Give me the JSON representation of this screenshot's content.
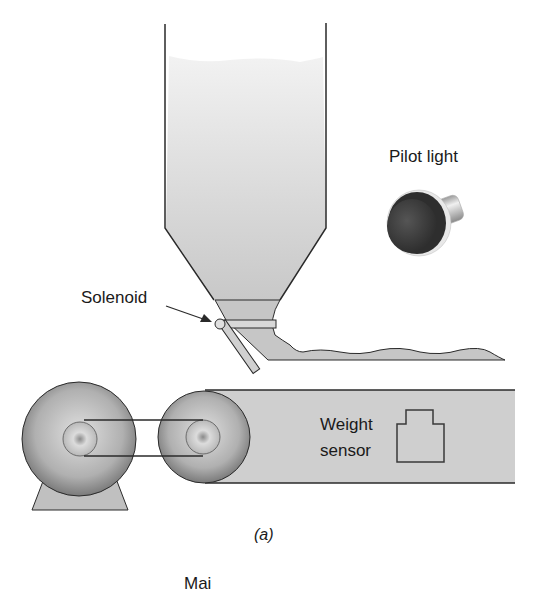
{
  "figure": {
    "caption": "(a)",
    "labels": {
      "pilot_light": "Pilot light",
      "solenoid": "Solenoid",
      "weight_line1": "Weight",
      "weight_line2": "sensor",
      "cut_off_text": "Mai"
    },
    "components": [
      "hopper",
      "solenoid-gate",
      "pilot-light",
      "conveyor-belt",
      "motor",
      "drive-pulley",
      "belt-drive",
      "weight-sensor"
    ],
    "colors": {
      "hopper_fill": "#d6d6d6",
      "material_fill": "#c4c4c4",
      "outline": "#2a2a2a",
      "pilot_dark": "#3a3a3a",
      "metal": "#c8c8c8"
    }
  }
}
